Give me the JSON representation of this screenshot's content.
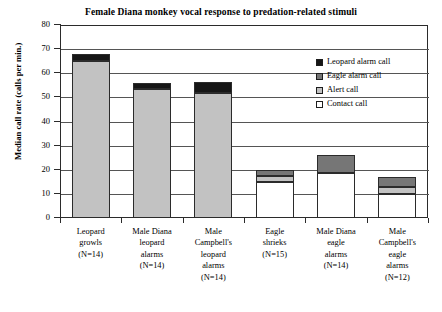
{
  "chart_data": {
    "type": "bar",
    "stacked": true,
    "title": "Female Diana monkey vocal response to predation-related stimuli",
    "xlabel": "",
    "ylabel": "Median call rate (calls per min.)",
    "ylim": [
      0,
      80
    ],
    "yticks": [
      0,
      10,
      20,
      30,
      40,
      50,
      60,
      70,
      80
    ],
    "grid": true,
    "legend_position": "top-right",
    "categories": [
      "Leopard growls (N=14)",
      "Male Diana leopard alarms (N=14)",
      "Male Campbell's leopard alarms (N=14)",
      "Eagle shrieks (N=15)",
      "Male Diana eagle alarms (N=14)",
      "Male Campbell's eagle alarms (N=12)"
    ],
    "category_lines": [
      [
        "Leopard",
        "growls",
        "(N=14)"
      ],
      [
        "Male Diana",
        "leopard",
        "alarms",
        "(N=14)"
      ],
      [
        "Male",
        "Campbell's",
        "leopard",
        "alarms",
        "(N=14)"
      ],
      [
        "Eagle",
        "shrieks",
        "(N=15)"
      ],
      [
        "Male Diana",
        "eagle",
        "alarms",
        "(N=14)"
      ],
      [
        "Male",
        "Campbell's",
        "eagle",
        "alarms",
        "(N=12)"
      ]
    ],
    "series": [
      {
        "name": "Leopard alarm call",
        "color": "#161616",
        "values": [
          3.0,
          2.5,
          4.5,
          0,
          0,
          0
        ]
      },
      {
        "name": "Eagle alarm call",
        "color": "#767676",
        "values": [
          0,
          0,
          0,
          2.5,
          7.5,
          4.0
        ]
      },
      {
        "name": "Alert call",
        "color": "#c2c2c2",
        "values": [
          65.0,
          53.5,
          52.0,
          2.5,
          0,
          3.0
        ]
      },
      {
        "name": "Contact call",
        "color": "#ffffff",
        "values": [
          0,
          0,
          0,
          15.0,
          18.5,
          10.0
        ]
      }
    ],
    "totals": [
      68.0,
      56.0,
      56.5,
      20.0,
      26.0,
      17.0
    ]
  },
  "legend": {
    "items": [
      {
        "label": "Leopard alarm call",
        "color": "#161616"
      },
      {
        "label": "Eagle alarm call",
        "color": "#767676"
      },
      {
        "label": "Alert call",
        "color": "#c2c2c2"
      },
      {
        "label": "Contact call",
        "color": "#ffffff"
      }
    ]
  }
}
